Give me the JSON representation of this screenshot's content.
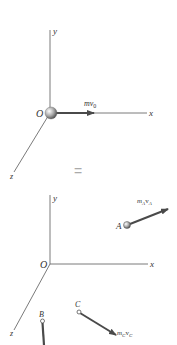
{
  "top_diagram": {
    "axes": {
      "x_label": "x",
      "y_label": "y",
      "z_label": "z"
    },
    "origin_label": "O",
    "momentum_label": "mv",
    "momentum_subscript": "0"
  },
  "equals_sign": "=",
  "bottom_diagram": {
    "axes": {
      "x_label": "x",
      "y_label": "y",
      "z_label": "z"
    },
    "origin_label": "O",
    "particles": [
      {
        "label": "A",
        "momentum_m": "m",
        "momentum_m_sub": "A",
        "momentum_v": "v",
        "momentum_v_sub": "A"
      },
      {
        "label": "B"
      },
      {
        "label": "C",
        "momentum_m": "m",
        "momentum_m_sub": "C",
        "momentum_v": "v",
        "momentum_v_sub": "C"
      }
    ]
  },
  "colors": {
    "axis": "#6b6b6b",
    "arrow": "#4a4a4a",
    "sphere": "#9a9a9a",
    "equals": "#b0b0b0"
  }
}
